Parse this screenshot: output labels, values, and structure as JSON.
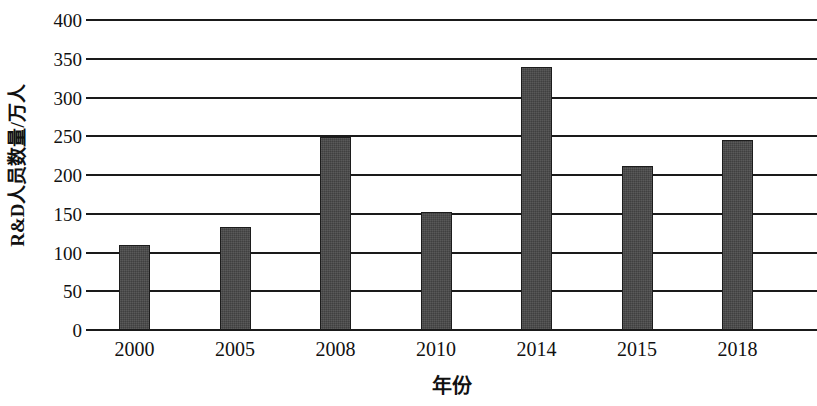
{
  "chart_data": {
    "type": "bar",
    "title": "",
    "subtitle": "",
    "categories": [
      "2000",
      "2005",
      "2008",
      "2010",
      "2014",
      "2015",
      "2018"
    ],
    "values": [
      110,
      133,
      249,
      152,
      339,
      211,
      245
    ],
    "xlabel": "年份",
    "ylabel": "R&D人员数量/万人",
    "ylim": [
      0,
      400
    ],
    "ytick_labels": [
      "0",
      "50",
      "100",
      "150",
      "200",
      "250",
      "300",
      "350",
      "400"
    ],
    "ytick_values": [
      0,
      50,
      100,
      150,
      200,
      250,
      300,
      350,
      400
    ],
    "grid": true,
    "grid_axis": "y",
    "legend": false,
    "legend_position": "none",
    "bar_color": "#474747",
    "bar_edge_color": "#1c1c1c",
    "axis_color": "#1a1a1a",
    "text_color": "#111111",
    "background_color": "#ffffff"
  }
}
